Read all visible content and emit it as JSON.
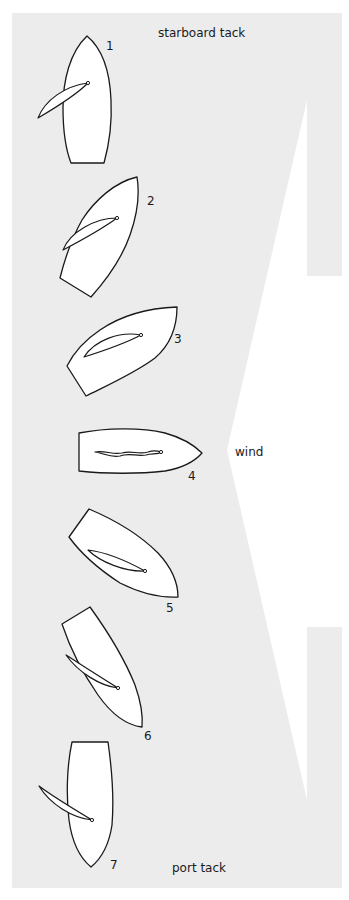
{
  "title_top": "starboard tack",
  "title_bottom": "port tack",
  "wind_label": "wind",
  "colors": {
    "panel": "#ececec",
    "arrow": "#ffffff",
    "line": "#1a1a1a"
  },
  "boats": [
    {
      "label": "1",
      "state": "starboard tack, close-hauled"
    },
    {
      "label": "2",
      "state": "heading up"
    },
    {
      "label": "3",
      "state": "heading up"
    },
    {
      "label": "4",
      "state": "head to wind, sail luffing"
    },
    {
      "label": "5",
      "state": "bearing away"
    },
    {
      "label": "6",
      "state": "bearing away"
    },
    {
      "label": "7",
      "state": "port tack, close-hauled"
    }
  ]
}
